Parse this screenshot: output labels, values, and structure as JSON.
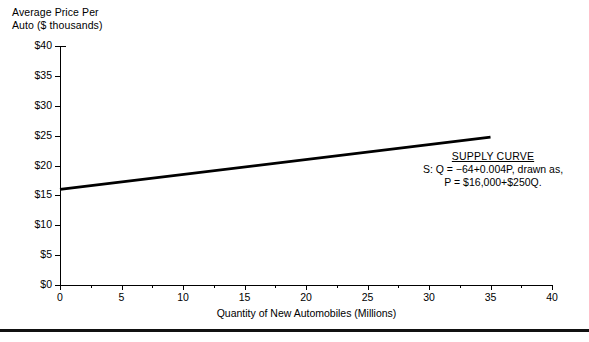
{
  "chart_data": {
    "type": "line",
    "title": "",
    "ylabel": "Average Price Per\nAuto ($ thousands)",
    "xlabel": "Quantity of New Automobiles (Millions)",
    "xlim": [
      0,
      40
    ],
    "ylim": [
      0,
      40
    ],
    "grid": false,
    "legend_position": "inline-annotation",
    "x_ticks": [
      0,
      5,
      10,
      15,
      20,
      25,
      30,
      35,
      40
    ],
    "x_tick_labels": [
      "0",
      "5",
      "10",
      "15",
      "20",
      "25",
      "30",
      "35",
      "40"
    ],
    "x_minor_ticks": [
      2.5,
      7.5,
      12.5,
      17.5,
      22.5,
      27.5,
      32.5,
      37.5
    ],
    "y_ticks": [
      0,
      5,
      10,
      15,
      20,
      25,
      30,
      35,
      40
    ],
    "y_tick_labels": [
      "$0",
      "$5",
      "$10",
      "$15",
      "$20",
      "$25",
      "$30",
      "$35",
      "$40"
    ],
    "series": [
      {
        "name": "Supply curve",
        "color": "#000000",
        "x": [
          0,
          35
        ],
        "y": [
          16,
          24.75
        ],
        "equation_quantity_form": "Q = -64+0.004P",
        "equation_price_form": "P = $16,000+$250Q",
        "intercept": 16,
        "slope_per_million": 0.25
      }
    ],
    "annotations": [
      {
        "title": "SUPPLY CURVE",
        "lines": [
          "S: Q = −64+0.004P, drawn as,",
          "P = $16,000+$250Q."
        ]
      }
    ]
  },
  "figure": {
    "y_axis_title": "Average Price Per\nAuto ($ thousands)",
    "x_axis_title": "Quantity of New Automobiles (Millions)",
    "annotation": {
      "title": "SUPPLY CURVE",
      "line1": "S: Q = −64+0.004P, drawn as,",
      "line2": "P = $16,000+$250Q."
    },
    "colors": {
      "line": "#000000",
      "axis": "#000000",
      "text": "#000000",
      "background": "#ffffff",
      "rule": "#111111"
    }
  }
}
